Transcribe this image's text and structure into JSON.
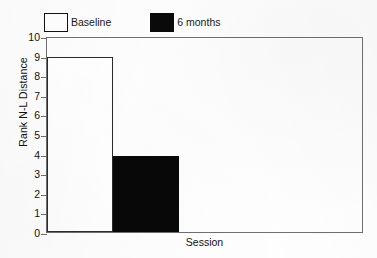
{
  "chart_data": {
    "type": "bar",
    "title": "",
    "subtitle": "",
    "xlabel": "Session",
    "ylabel": "Rank N-L Distance",
    "categories": [
      "Session"
    ],
    "series": [
      {
        "name": "Baseline",
        "values": [
          8.95
        ],
        "swatch": "open",
        "color": "#ffffff"
      },
      {
        "name": "6 months",
        "values": [
          3.9
        ],
        "swatch": "filled",
        "color": "#080808"
      }
    ],
    "ylim": [
      0,
      10
    ],
    "ytick_labels": [
      "10",
      "9",
      "8",
      "7",
      "6",
      "5",
      "4",
      "3",
      "2",
      "1",
      "0"
    ],
    "ytick_values": [
      10,
      9,
      8,
      7,
      6,
      5,
      4,
      3,
      2,
      1,
      0
    ],
    "xtick_labels": [],
    "grid": false,
    "legend_position": "top-left",
    "axis_color": "#6f6f6f",
    "text_color": "#111111",
    "background": "#ffffff"
  },
  "legend": {
    "entries": [
      {
        "label": "Baseline"
      },
      {
        "label": "6 months"
      }
    ]
  },
  "axes": {
    "y_title": "Rank N-L Distance",
    "x_title": "Session"
  }
}
